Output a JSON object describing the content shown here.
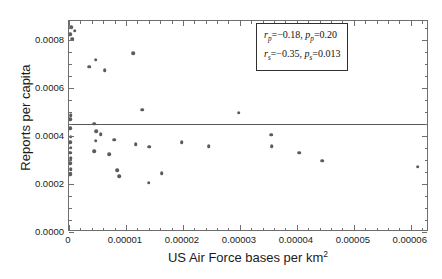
{
  "chart_data": {
    "type": "scatter",
    "title": "",
    "xlabel": "US Air Force bases per km2",
    "xlabel_base": "US Air Force bases per km",
    "xlabel_exponent": "2",
    "ylabel": "Reports per capita",
    "xlim": [
      0,
      6.32e-05
    ],
    "ylim": [
      0,
      0.00088
    ],
    "xticks": [
      0,
      1e-05,
      2e-05,
      3e-05,
      4e-05,
      5e-05,
      6e-05
    ],
    "xticklabels": [
      "0",
      "0.00001",
      "0.00002",
      "0.00003",
      "0.00004",
      "0.00005",
      "0.00006"
    ],
    "yticks": [
      0,
      0.0002,
      0.0004,
      0.0006,
      0.0008
    ],
    "yticklabels": [
      "0.0000",
      "0.0002",
      "0.0004",
      "0.0006",
      "0.0008"
    ],
    "x_minor_per_major": 5,
    "y_minor_per_major": 4,
    "grid": false,
    "frame": true,
    "marker_color": "#5a5a5f",
    "line_color": "#55555a",
    "points": [
      {
        "x": 4e-07,
        "y": 0.000855
      },
      {
        "x": 1e-06,
        "y": 0.00084
      },
      {
        "x": 2e-07,
        "y": 0.000825
      },
      {
        "x": 6e-07,
        "y": 0.000806
      },
      {
        "x": 4.7e-06,
        "y": 0.000719
      },
      {
        "x": 1.13e-05,
        "y": 0.000745
      },
      {
        "x": 3.5e-06,
        "y": 0.00069
      },
      {
        "x": 6.3e-06,
        "y": 0.000676
      },
      {
        "x": 3e-07,
        "y": 0.000487
      },
      {
        "x": 2e-07,
        "y": 0.00047
      },
      {
        "x": 1.28e-05,
        "y": 0.00051
      },
      {
        "x": 2.98e-05,
        "y": 0.000497
      },
      {
        "x": 4.4e-06,
        "y": 0.000452
      },
      {
        "x": 2e-07,
        "y": 0.000432
      },
      {
        "x": 4.8e-06,
        "y": 0.00042
      },
      {
        "x": 5.6e-06,
        "y": 0.000408
      },
      {
        "x": 3e-07,
        "y": 0.000398
      },
      {
        "x": 4.7e-06,
        "y": 0.000381
      },
      {
        "x": 7.9e-06,
        "y": 0.000385
      },
      {
        "x": 2e-07,
        "y": 0.000374
      },
      {
        "x": 1.17e-05,
        "y": 0.000366
      },
      {
        "x": 1.41e-05,
        "y": 0.000356
      },
      {
        "x": 1.98e-05,
        "y": 0.000374
      },
      {
        "x": 3e-07,
        "y": 0.000352
      },
      {
        "x": 4.4e-06,
        "y": 0.000337
      },
      {
        "x": 2e-07,
        "y": 0.00033
      },
      {
        "x": 7.1e-06,
        "y": 0.000325
      },
      {
        "x": 2.45e-05,
        "y": 0.000359
      },
      {
        "x": 3.55e-05,
        "y": 0.000406
      },
      {
        "x": 3.56e-05,
        "y": 0.000357
      },
      {
        "x": 4.04e-05,
        "y": 0.00033
      },
      {
        "x": 4.44e-05,
        "y": 0.000297
      },
      {
        "x": 6.12e-05,
        "y": 0.000272
      },
      {
        "x": 3e-07,
        "y": 0.000308
      },
      {
        "x": 2e-07,
        "y": 0.000288
      },
      {
        "x": 8.5e-06,
        "y": 0.000258
      },
      {
        "x": 8.8e-06,
        "y": 0.000232
      },
      {
        "x": 3e-07,
        "y": 0.000262
      },
      {
        "x": 1.63e-05,
        "y": 0.000244
      },
      {
        "x": 1.4e-05,
        "y": 0.000205
      },
      {
        "x": 2e-07,
        "y": 0.00024
      }
    ],
    "regression_line": {
      "type": "horizontal",
      "y": 0.000448
    },
    "annotations": {
      "stats_box": {
        "line1": {
          "r_symbol": "r",
          "r_sub": "p",
          "r_value": "=−0.18,",
          "p_symbol": "p",
          "p_sub": "p",
          "p_value": "=0.20"
        },
        "line2": {
          "r_symbol": "r",
          "r_sub": "s",
          "r_value": "=−0.35,",
          "p_symbol": "p",
          "p_sub": "s",
          "p_value": "=0.013"
        }
      }
    },
    "watermark": {
      "text1": "",
      "text2": ""
    }
  }
}
